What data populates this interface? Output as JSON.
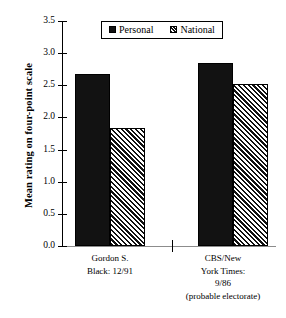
{
  "chart_data": {
    "type": "bar",
    "title": "",
    "subtitle": "",
    "xlabel": "",
    "ylabel": "Mean rating on four-point scale",
    "ylim": [
      0.0,
      3.5
    ],
    "yticks": [
      "0.0",
      "0.5",
      "1.0",
      "1.5",
      "2.0",
      "2.5",
      "3.0",
      "3.5"
    ],
    "ytick_values": [
      0.0,
      0.5,
      1.0,
      1.5,
      2.0,
      2.5,
      3.0,
      3.5
    ],
    "grid": false,
    "legend_position": "top-center",
    "categories": [
      "Gordon S. Black: 12/91",
      "CBS/New York Times: 9/86 (probable electorate)"
    ],
    "category_label_lines": [
      [
        "Gordon S.",
        "Black: 12/91"
      ],
      [
        "CBS/New",
        "York Times:",
        "9/86",
        "(probable electorate)"
      ]
    ],
    "series": [
      {
        "name": "Personal",
        "values": [
          2.68,
          2.85
        ],
        "fill": "solid",
        "color": "#121212"
      },
      {
        "name": "National",
        "values": [
          1.83,
          2.52
        ],
        "fill": "hatched",
        "color": "#111111"
      }
    ]
  },
  "legend": {
    "items": [
      {
        "label": "Personal",
        "fill": "solid"
      },
      {
        "label": "National",
        "fill": "hatched"
      }
    ]
  },
  "axis": {
    "y_title": "Mean rating on four-point scale",
    "ticks": [
      {
        "label": "3.5",
        "value": 3.5
      },
      {
        "label": "3.0",
        "value": 3.0
      },
      {
        "label": "2.5",
        "value": 2.5
      },
      {
        "label": "2.0",
        "value": 2.0
      },
      {
        "label": "1.5",
        "value": 1.5
      },
      {
        "label": "1.0",
        "value": 1.0
      },
      {
        "label": "0.5",
        "value": 0.5
      },
      {
        "label": "0.0",
        "value": 0.0
      }
    ]
  },
  "categories_display": {
    "group1": {
      "line1": "Gordon S.",
      "line2": "Black: 12/91"
    },
    "group2": {
      "line1": "CBS/New",
      "line2": "York Times:",
      "line3": "9/86",
      "line4": "(probable electorate)"
    }
  }
}
